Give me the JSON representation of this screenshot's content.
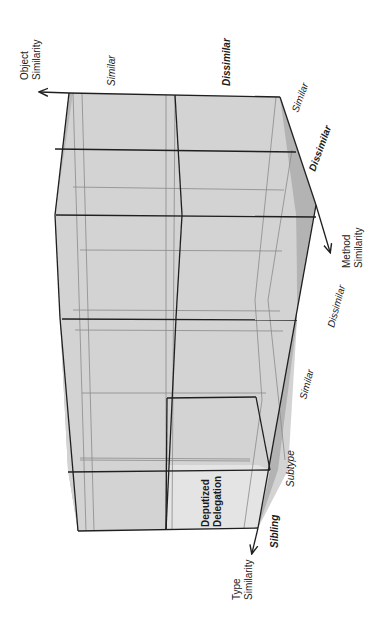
{
  "diagram": {
    "orientation": "rotated 90 degrees clockwise",
    "axes": {
      "object": {
        "label_line1": "Object",
        "label_line2": "Similarity",
        "values": [
          "Similar",
          "Dissimilar"
        ],
        "highlighted": "Dissimilar"
      },
      "method": {
        "label_line1": "Method",
        "label_line2": "Similarity",
        "values": [
          "Similar",
          "Dissimilar"
        ]
      },
      "method_top": {
        "values": [
          "Similar",
          "Dissimilar"
        ],
        "highlighted": "Dissimilar"
      },
      "type": {
        "label_line1": "Type",
        "label_line2": "Similarity",
        "values": [
          "Subtype",
          "Sibling"
        ],
        "highlighted": "Sibling"
      }
    },
    "highlighted_cell": {
      "line1": "Deputized",
      "line2": "Delegation"
    },
    "colors": {
      "face_light": "#d6d6d6",
      "face_mid": "#c4c4c4",
      "face_dark": "#a9a9a9",
      "highlight_cell": "#e2e2e2",
      "edge": "#1f1f1f",
      "inner_edge": "#8a8a8a"
    }
  }
}
